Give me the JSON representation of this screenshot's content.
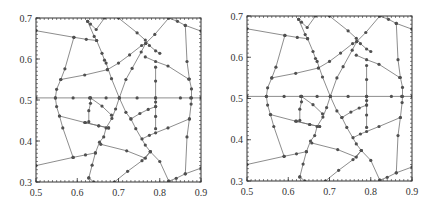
{
  "chart_data": [
    {
      "type": "line",
      "title": "",
      "xlabel": "",
      "ylabel": "",
      "xlim": [
        0.5,
        0.9
      ],
      "ylim": [
        0.3,
        0.7
      ],
      "xticks": [
        "0.5",
        "0.6",
        "0.7",
        "0.8",
        "0.9"
      ],
      "yticks": [
        "0.3",
        "0.4",
        "0.5",
        "0.6",
        "0.7"
      ],
      "grid": false,
      "legend": null,
      "marker": "circle",
      "line_color": "#707070",
      "marker_color": "#505050",
      "polylines": [
        [
          [
            0.5,
            0.505
          ],
          [
            0.547,
            0.505
          ],
          [
            0.59,
            0.505
          ],
          [
            0.63,
            0.505
          ],
          [
            0.67,
            0.505
          ],
          [
            0.702,
            0.505
          ],
          [
            0.745,
            0.505
          ],
          [
            0.79,
            0.505
          ],
          [
            0.85,
            0.505
          ],
          [
            0.875,
            0.505
          ],
          [
            0.9,
            0.505
          ]
        ],
        [
          [
            0.5,
            0.669
          ],
          [
            0.592,
            0.653
          ],
          [
            0.622,
            0.648
          ],
          [
            0.647,
            0.645
          ]
        ],
        [
          [
            0.625,
            0.692
          ],
          [
            0.632,
            0.685
          ],
          [
            0.646,
            0.672
          ],
          [
            0.666,
            0.7
          ]
        ],
        [
          [
            0.625,
            0.692
          ],
          [
            0.641,
            0.655
          ],
          [
            0.647,
            0.645
          ],
          [
            0.66,
            0.614
          ],
          [
            0.666,
            0.597
          ],
          [
            0.67,
            0.59
          ],
          [
            0.683,
            0.552
          ],
          [
            0.702,
            0.505
          ],
          [
            0.718,
            0.47
          ],
          [
            0.73,
            0.454
          ],
          [
            0.742,
            0.43
          ],
          [
            0.765,
            0.39
          ],
          [
            0.777,
            0.374
          ],
          [
            0.8,
            0.35
          ],
          [
            0.822,
            0.302
          ]
        ],
        [
          [
            0.592,
            0.653
          ],
          [
            0.57,
            0.576
          ],
          [
            0.56,
            0.55
          ],
          [
            0.55,
            0.526
          ],
          [
            0.547,
            0.505
          ],
          [
            0.55,
            0.484
          ],
          [
            0.557,
            0.461
          ],
          [
            0.565,
            0.432
          ],
          [
            0.59,
            0.36
          ]
        ],
        [
          [
            0.56,
            0.55
          ],
          [
            0.618,
            0.561
          ],
          [
            0.673,
            0.574
          ]
        ],
        [
          [
            0.557,
            0.461
          ],
          [
            0.618,
            0.445
          ],
          [
            0.652,
            0.437
          ],
          [
            0.676,
            0.432
          ]
        ],
        [
          [
            0.5,
            0.34
          ],
          [
            0.59,
            0.36
          ],
          [
            0.62,
            0.366
          ],
          [
            0.644,
            0.371
          ]
        ],
        [
          [
            0.628,
            0.31
          ],
          [
            0.636,
            0.341
          ],
          [
            0.644,
            0.371
          ],
          [
            0.654,
            0.397
          ],
          [
            0.664,
            0.41
          ],
          [
            0.67,
            0.432
          ],
          [
            0.684,
            0.455
          ],
          [
            0.693,
            0.478
          ],
          [
            0.702,
            0.505
          ],
          [
            0.718,
            0.55
          ],
          [
            0.733,
            0.577
          ],
          [
            0.755,
            0.617
          ],
          [
            0.766,
            0.638
          ],
          [
            0.788,
            0.66
          ],
          [
            0.822,
            0.7
          ]
        ],
        [
          [
            0.673,
            0.574
          ],
          [
            0.7,
            0.59
          ],
          [
            0.727,
            0.61
          ],
          [
            0.756,
            0.633
          ],
          [
            0.766,
            0.638
          ]
        ],
        [
          [
            0.7,
            0.7
          ],
          [
            0.745,
            0.664
          ],
          [
            0.765,
            0.646
          ],
          [
            0.775,
            0.633
          ],
          [
            0.79,
            0.62
          ],
          [
            0.8,
            0.614
          ]
        ],
        [
          [
            0.765,
            0.605
          ],
          [
            0.79,
            0.594
          ],
          [
            0.82,
            0.583
          ],
          [
            0.87,
            0.551
          ]
        ],
        [
          [
            0.822,
            0.7
          ],
          [
            0.843,
            0.692
          ],
          [
            0.862,
            0.682
          ],
          [
            0.9,
            0.668
          ]
        ],
        [
          [
            0.862,
            0.682
          ],
          [
            0.866,
            0.594
          ],
          [
            0.872,
            0.551
          ],
          [
            0.877,
            0.527
          ],
          [
            0.877,
            0.505
          ],
          [
            0.876,
            0.49
          ],
          [
            0.872,
            0.454
          ],
          [
            0.866,
            0.41
          ],
          [
            0.862,
            0.32
          ]
        ],
        [
          [
            0.79,
            0.58
          ],
          [
            0.79,
            0.546
          ],
          [
            0.79,
            0.505
          ],
          [
            0.79,
            0.495
          ],
          [
            0.79,
            0.484
          ],
          [
            0.79,
            0.46
          ],
          [
            0.79,
            0.43
          ]
        ],
        [
          [
            0.73,
            0.454
          ],
          [
            0.752,
            0.467
          ],
          [
            0.772,
            0.477
          ],
          [
            0.79,
            0.484
          ]
        ],
        [
          [
            0.757,
            0.405
          ],
          [
            0.775,
            0.414
          ],
          [
            0.79,
            0.42
          ],
          [
            0.82,
            0.432
          ],
          [
            0.872,
            0.454
          ]
        ],
        [
          [
            0.632,
            0.505
          ],
          [
            0.632,
            0.492
          ],
          [
            0.628,
            0.474
          ],
          [
            0.628,
            0.447
          ]
        ],
        [
          [
            0.632,
            0.505
          ],
          [
            0.66,
            0.485
          ],
          [
            0.683,
            0.463
          ]
        ],
        [
          [
            0.62,
            0.445
          ],
          [
            0.652,
            0.437
          ],
          [
            0.676,
            0.432
          ]
        ],
        [
          [
            0.657,
            0.392
          ],
          [
            0.72,
            0.376
          ],
          [
            0.765,
            0.358
          ],
          [
            0.777,
            0.374
          ]
        ],
        [
          [
            0.69,
            0.3
          ],
          [
            0.722,
            0.326
          ],
          [
            0.757,
            0.352
          ],
          [
            0.777,
            0.374
          ]
        ],
        [
          [
            0.822,
            0.302
          ],
          [
            0.84,
            0.309
          ],
          [
            0.862,
            0.32
          ],
          [
            0.9,
            0.334
          ]
        ],
        [
          [
            0.628,
            0.31
          ],
          [
            0.64,
            0.3
          ]
        ]
      ]
    },
    {
      "type": "line",
      "title": "",
      "xlabel": "",
      "ylabel": "",
      "xlim": [
        0.5,
        0.9
      ],
      "ylim": [
        0.3,
        0.7
      ],
      "xticks": [
        "0.5",
        "0.6",
        "0.7",
        "0.8",
        "0.9"
      ],
      "yticks": [
        "0.3",
        "0.4",
        "0.5",
        "0.6",
        "0.7"
      ],
      "grid": false,
      "legend": null,
      "marker": "circle",
      "line_color": "#707070",
      "marker_color": "#505050",
      "polylines": "same as panel 1"
    }
  ]
}
